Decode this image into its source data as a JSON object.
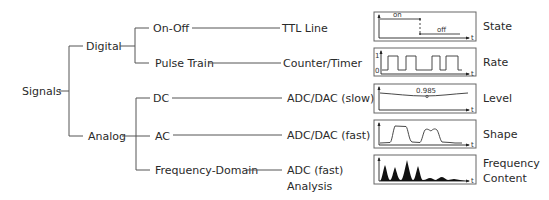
{
  "diagram": {
    "root": {
      "label": "Signals"
    },
    "branches": [
      {
        "label": "Digital",
        "children": [
          {
            "label": "On-Off",
            "hardware": "TTL Line",
            "plot": "state",
            "property": "State"
          },
          {
            "label": "Pulse Train",
            "hardware": "Counter/Timer",
            "plot": "rate",
            "property": "Rate"
          }
        ]
      },
      {
        "label": "Analog",
        "children": [
          {
            "label": "DC",
            "hardware": "ADC/DAC (slow)",
            "plot": "level",
            "property": "Level"
          },
          {
            "label": "AC",
            "hardware": "ADC/DAC (fast)",
            "plot": "shape",
            "property": "Shape"
          },
          {
            "label": "Frequency-Domain",
            "hardware": "ADC (fast)",
            "hardware_line2": "Analysis",
            "plot": "frequency",
            "property": "Frequency",
            "property_line2": "Content"
          }
        ]
      }
    ],
    "plots": {
      "state": {
        "on_label": "on",
        "off_label": "off",
        "axis_label": "t"
      },
      "rate": {
        "high_label": "1",
        "low_label": "0",
        "axis_label": "t"
      },
      "level": {
        "value_label": "0.985",
        "axis_label": "t"
      },
      "shape": {
        "axis_label": "t"
      },
      "frequency": {
        "axis_label": "t"
      }
    }
  }
}
